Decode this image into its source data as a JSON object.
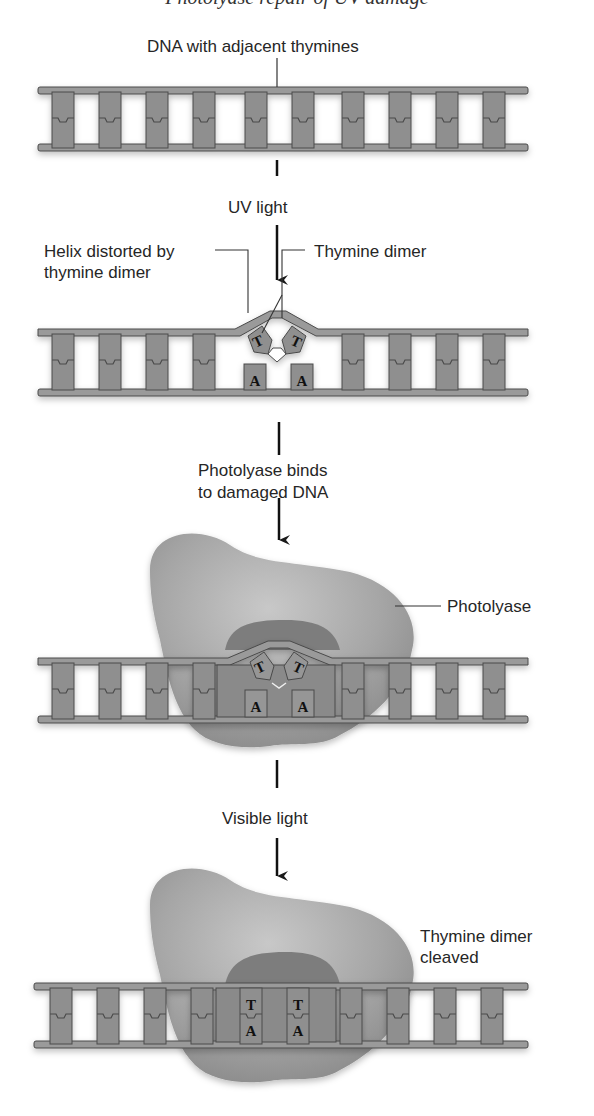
{
  "diagram": {
    "cutoff_caption": "Photolyase repair of UV damage",
    "labels": {
      "dna_adjacent": "DNA with adjacent thymines",
      "uv_light": "UV light",
      "helix_distorted_line1": "Helix distorted by",
      "helix_distorted_line2": "thymine dimer",
      "thymine_dimer": "Thymine dimer",
      "photolyase_binds_line1": "Photolyase binds",
      "photolyase_binds_line2": "to damaged DNA",
      "photolyase": "Photolyase",
      "visible_light": "Visible light",
      "dimer_cleaved_line1": "Thymine dimer",
      "dimer_cleaved_line2": "cleaved"
    },
    "bases": {
      "thymine": "T",
      "adenine": "A"
    },
    "stages": [
      {
        "id": "intact",
        "description": "DNA with adjacent thymines"
      },
      {
        "id": "uv_damage",
        "description": "Helix distorted by thymine dimer"
      },
      {
        "id": "enzyme_bound",
        "description": "Photolyase binds to damaged DNA"
      },
      {
        "id": "repaired",
        "description": "Thymine dimer cleaved"
      }
    ],
    "colors": {
      "strand": "#8f8f8f",
      "strand_outline": "#4a4a4a",
      "enzyme": "#a9a9a9",
      "enzyme_shadow": "#7d7d7d",
      "text": "#262626"
    }
  }
}
